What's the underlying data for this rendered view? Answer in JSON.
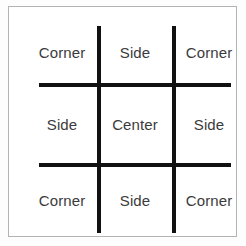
{
  "figure": {
    "kind": "tic-tac-toe-position-diagram",
    "background_color": "#ffffff",
    "frame_color": "#b3b3b3",
    "line_color": "#111111",
    "label_color": "#3b3b3b"
  },
  "board": {
    "rows": 3,
    "columns": 3,
    "cells": [
      {
        "row": 1,
        "col": 1,
        "label": "Corner"
      },
      {
        "row": 1,
        "col": 2,
        "label": "Side"
      },
      {
        "row": 1,
        "col": 3,
        "label": "Corner"
      },
      {
        "row": 2,
        "col": 1,
        "label": "Side"
      },
      {
        "row": 2,
        "col": 2,
        "label": "Center"
      },
      {
        "row": 2,
        "col": 3,
        "label": "Side"
      },
      {
        "row": 3,
        "col": 1,
        "label": "Corner"
      },
      {
        "row": 3,
        "col": 2,
        "label": "Side"
      },
      {
        "row": 3,
        "col": 3,
        "label": "Corner"
      }
    ]
  },
  "grid_lines": [
    {
      "name": "vline-left",
      "orientation": "vertical"
    },
    {
      "name": "vline-right",
      "orientation": "vertical"
    },
    {
      "name": "hline-top",
      "orientation": "horizontal"
    },
    {
      "name": "hline-bottom",
      "orientation": "horizontal"
    }
  ]
}
